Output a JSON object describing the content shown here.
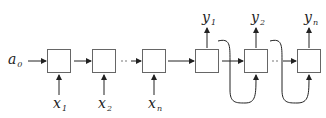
{
  "diagram": {
    "initial_state": {
      "base": "a",
      "sub": "0"
    },
    "inputs": [
      {
        "base": "x",
        "sub": "1"
      },
      {
        "base": "x",
        "sub": "2"
      },
      {
        "base": "x",
        "sub": "n"
      }
    ],
    "outputs": [
      {
        "base": "y",
        "sub": "1"
      },
      {
        "base": "y",
        "sub": "2"
      },
      {
        "base": "y",
        "sub": "n"
      }
    ],
    "colors": {
      "stroke": "#333333",
      "box_stroke": "#555555",
      "background": "#ffffff"
    }
  }
}
